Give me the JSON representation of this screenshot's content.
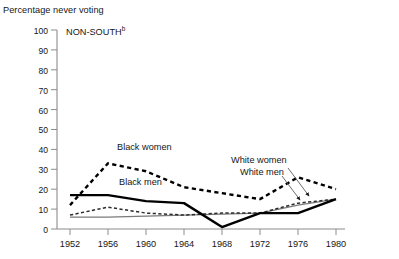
{
  "chart_data": {
    "type": "line",
    "title": "NON-SOUTH",
    "title_superscript": "b",
    "ylabel": "Percentage never voting",
    "xlabel": "",
    "categories": [
      1952,
      1956,
      1960,
      1964,
      1968,
      1972,
      1976,
      1980
    ],
    "x_tick_labels": [
      "1952",
      "1956",
      "1960",
      "1964",
      "1968",
      "1972",
      "1976",
      "1980"
    ],
    "y_tick_labels": [
      "0",
      "10",
      "20",
      "30",
      "40",
      "50",
      "60",
      "70",
      "80",
      "90",
      "100"
    ],
    "ylim": [
      0,
      100
    ],
    "ytick_step": 10,
    "grid": false,
    "legend": "inline-labels",
    "series": [
      {
        "name": "Black women",
        "style": "dashed",
        "width": "thick",
        "color": "#000000",
        "values": [
          12,
          33,
          29,
          21,
          18,
          15,
          26,
          20
        ]
      },
      {
        "name": "Black men",
        "style": "solid",
        "width": "thick",
        "color": "#000000",
        "values": [
          17,
          17,
          14,
          13,
          1,
          8,
          8,
          15
        ]
      },
      {
        "name": "White women",
        "style": "dashed",
        "width": "thin",
        "color": "#333333",
        "values": [
          7,
          11,
          8,
          7,
          8,
          8,
          13,
          15
        ]
      },
      {
        "name": "White men",
        "style": "solid",
        "width": "thin",
        "color": "#7a7a7a",
        "values": [
          6,
          6,
          6.5,
          7,
          7.5,
          8,
          12,
          15
        ]
      }
    ],
    "annotations": [
      {
        "text": "Black women",
        "x": 1958.0,
        "y": 38
      },
      {
        "text": "Black men",
        "x": 1959.0,
        "y": 22
      },
      {
        "text": "White women",
        "x": 1969.5,
        "y": 31,
        "leader_to_series": "White women"
      },
      {
        "text": "White men",
        "x": 1970.2,
        "y": 26,
        "leader_to_series": "White men"
      }
    ]
  },
  "labels": {
    "axis_title": "Percentage never voting",
    "panel_title": "NON-SOUTH",
    "panel_title_sup": "b",
    "black_women": "Black women",
    "black_men": "Black men",
    "white_women": "White women",
    "white_men": "White men"
  },
  "yticks": [
    {
      "value": "100",
      "top": 26
    },
    {
      "value": "90",
      "top": 45
    },
    {
      "value": "80",
      "top": 65
    },
    {
      "value": "70",
      "top": 85
    },
    {
      "value": "60",
      "top": 105
    },
    {
      "value": "50",
      "top": 125
    },
    {
      "value": "40",
      "top": 145
    },
    {
      "value": "30",
      "top": 165
    },
    {
      "value": "20",
      "top": 185
    },
    {
      "value": "10",
      "top": 205
    },
    {
      "value": "0",
      "top": 224
    }
  ],
  "xticks": [
    {
      "value": "1952",
      "left": 50
    },
    {
      "value": "1956",
      "left": 88
    },
    {
      "value": "1960",
      "left": 126
    },
    {
      "value": "1964",
      "left": 164
    },
    {
      "value": "1968",
      "left": 202
    },
    {
      "value": "1972",
      "left": 240
    },
    {
      "value": "1976",
      "left": 278
    },
    {
      "value": "1980",
      "left": 316
    }
  ]
}
